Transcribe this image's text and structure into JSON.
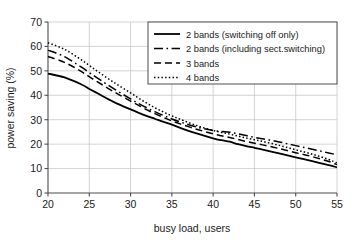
{
  "chart_data": {
    "type": "line",
    "title": "",
    "xlabel": "busy load, users",
    "ylabel": "power saving (%)",
    "xlim": [
      20,
      55
    ],
    "ylim": [
      0,
      70
    ],
    "xticks": [
      20,
      25,
      30,
      35,
      40,
      45,
      50,
      55
    ],
    "yticks": [
      0,
      10,
      20,
      30,
      40,
      50,
      60,
      70
    ],
    "grid": true,
    "legend_position": "upper right",
    "x": [
      20,
      22,
      24,
      25,
      26,
      28,
      30,
      31,
      32,
      33,
      34,
      35,
      36,
      38,
      40,
      41,
      42,
      43,
      44,
      45,
      46,
      48,
      50,
      52,
      54,
      55
    ],
    "series": [
      {
        "name": "2 bands (switching off only)",
        "style": "solid",
        "values": [
          48.9,
          47.3,
          44.5,
          42.6,
          40.8,
          37.2,
          34.2,
          32.8,
          31.5,
          30.3,
          29.1,
          28.0,
          26.7,
          24.4,
          22.4,
          21.6,
          21.0,
          20.0,
          19.2,
          18.5,
          17.8,
          16.2,
          14.6,
          13.0,
          11.4,
          10.5
        ]
      },
      {
        "name": "2 bands (including sect.switching)",
        "style": "dashdot",
        "values": [
          58.5,
          55.8,
          51.6,
          49.3,
          47.0,
          42.6,
          38.5,
          36.6,
          34.8,
          33.2,
          31.7,
          30.3,
          29.1,
          27.0,
          25.6,
          25.2,
          24.9,
          24.2,
          23.5,
          22.8,
          22.2,
          20.9,
          19.4,
          17.9,
          16.4,
          15.6
        ]
      },
      {
        "name": "3 bands",
        "style": "dashed",
        "values": [
          55.9,
          53.5,
          49.8,
          47.6,
          45.5,
          41.4,
          37.6,
          35.8,
          34.0,
          32.4,
          30.9,
          29.5,
          28.3,
          26.1,
          24.2,
          23.4,
          22.7,
          21.9,
          21.1,
          20.4,
          19.7,
          18.2,
          16.5,
          14.9,
          12.9,
          11.6
        ]
      },
      {
        "name": "4 bands",
        "style": "dotted",
        "values": [
          61.5,
          58.8,
          54.6,
          52.2,
          49.8,
          45.2,
          41.0,
          38.8,
          36.7,
          34.8,
          33.1,
          31.6,
          30.2,
          27.6,
          25.6,
          24.8,
          24.1,
          23.3,
          22.5,
          21.8,
          21.1,
          19.5,
          17.7,
          15.9,
          13.7,
          12.3
        ]
      }
    ],
    "legend_entries": [
      {
        "label": "2 bands (switching off only)",
        "style": "solid"
      },
      {
        "label": "2 bands (including sect.switching)",
        "style": "dashdot"
      },
      {
        "label": "3 bands",
        "style": "dashed"
      },
      {
        "label": "4 bands",
        "style": "dotted"
      }
    ]
  }
}
